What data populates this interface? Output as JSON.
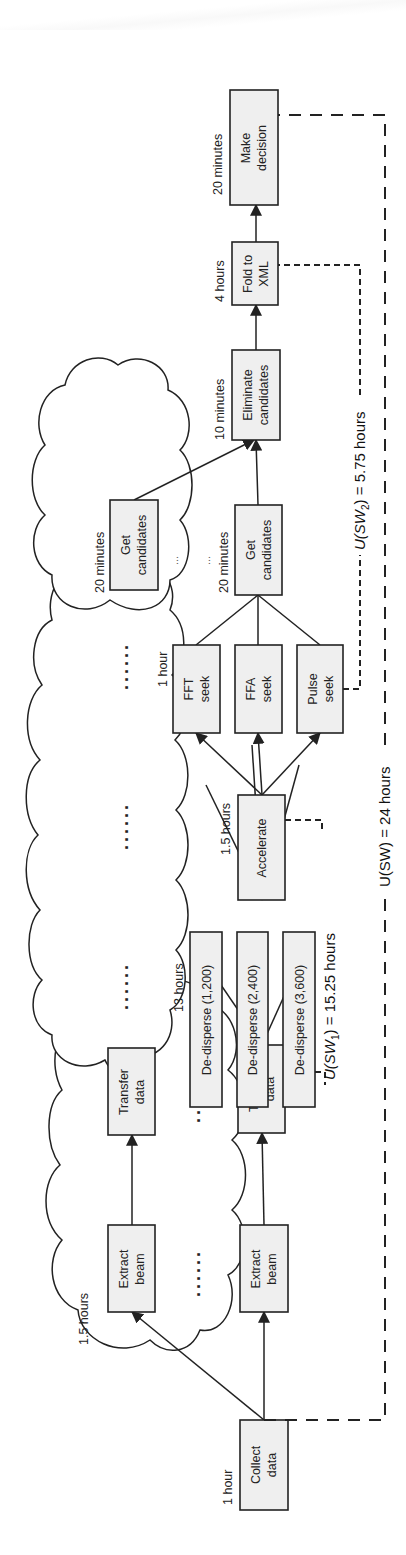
{
  "diagram": {
    "nodes": {
      "collect": {
        "line1": "Collect",
        "line2": "data",
        "time": "1 hour"
      },
      "extract_top": {
        "line1": "Extract",
        "line2": "beam"
      },
      "extract_bottom": {
        "line1": "Extract",
        "line2": "beam"
      },
      "extract_time": "1.5 hours",
      "transfer_top": {
        "line1": "Transfer",
        "line2": "data"
      },
      "transfer_bottom": {
        "line1": "Transfer",
        "line2": "data"
      },
      "dedisperse": [
        {
          "label": "De-disperse (1,200)"
        },
        {
          "label": "De-disperse (2,400)"
        },
        {
          "label": "De-disperse (3,600)"
        }
      ],
      "dedisperse_time": "13 hours",
      "accelerate": {
        "line1": "Accelerate",
        "time": "1.5 hours"
      },
      "seeks": [
        {
          "line1": "FFT",
          "line2": "seek"
        },
        {
          "line1": "FFA",
          "line2": "seek"
        },
        {
          "line1": "Pulse",
          "line2": "seek"
        }
      ],
      "seek_time": "1 hour",
      "get_candidates_main": {
        "line1": "Get",
        "line2": "candidates",
        "time": "20 minutes"
      },
      "get_candidates_cloud": {
        "line1": "Get",
        "line2": "candidates",
        "time": "20 minutes"
      },
      "eliminate": {
        "line1": "Eliminate",
        "line2": "candidates",
        "time": "10 minutes"
      },
      "fold": {
        "line1": "Fold to",
        "line2": "XML",
        "time": "4 hours"
      },
      "decision": {
        "line1": "Make",
        "line2": "decision",
        "time": "20 minutes"
      }
    },
    "ellipsis": {
      "dots6": "......",
      "dots3": "...",
      "small": "..."
    },
    "sub_workflows": {
      "sw1": {
        "prefix": "U(SW",
        "sub": "1",
        "suffix": ") = 15.25 hours"
      },
      "sw2": {
        "prefix": "U(SW",
        "sub": "2",
        "suffix": ") = 5.75 hours"
      },
      "sw": {
        "label": "U(SW) = 24 hours"
      }
    },
    "colors": {
      "box_fill": "#efefef",
      "stroke": "#222222",
      "background": "#ffffff"
    }
  }
}
